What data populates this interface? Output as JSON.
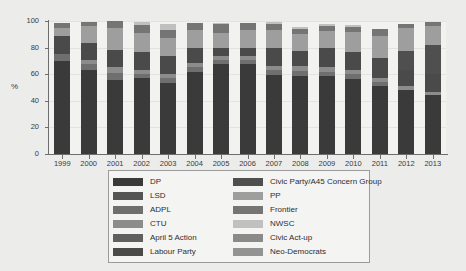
{
  "chart_data": {
    "type": "bar",
    "subtype": "stacked-100-percent",
    "title": "",
    "xlabel": "",
    "ylabel": "%",
    "ylim": [
      0,
      100
    ],
    "yticks": [
      0,
      20,
      40,
      60,
      80,
      100
    ],
    "grid": true,
    "legend_position": "below-plot",
    "legend_columns": 2,
    "categories": [
      "1999",
      "2000",
      "2001",
      "2002",
      "2003",
      "2004",
      "2005",
      "2006",
      "2007",
      "2008",
      "2009",
      "2010",
      "2011",
      "2012",
      "2013"
    ],
    "series": [
      {
        "name": "DP",
        "color": "#3a3a3a",
        "values": [
          70.0,
          63.0,
          55.5,
          57.0,
          53.5,
          62.0,
          67.5,
          67.5,
          59.5,
          59.0,
          58.5,
          56.5,
          51.5,
          48.0,
          44.5
        ]
      },
      {
        "name": "LSD",
        "color": "#545454",
        "values": [
          0.0,
          0.0,
          0.0,
          0.0,
          0.0,
          0.0,
          0.0,
          0.0,
          0.0,
          0.0,
          0.0,
          0.0,
          0.0,
          0.0,
          0.0
        ]
      },
      {
        "name": "ADPL",
        "color": "#6f6f6f",
        "values": [
          5.5,
          4.5,
          5.5,
          3.5,
          4.0,
          3.5,
          3.0,
          3.0,
          3.5,
          3.5,
          3.5,
          3.5,
          3.0,
          0.0,
          0.0
        ]
      },
      {
        "name": "CTU",
        "color": "#8c8c8c",
        "values": [
          0.0,
          3.0,
          4.5,
          3.0,
          3.0,
          3.0,
          3.5,
          3.0,
          3.5,
          3.5,
          3.5,
          3.5,
          3.0,
          3.0,
          2.5
        ]
      },
      {
        "name": "April 5 Action",
        "color": "#606060",
        "values": [
          0.0,
          0.0,
          0.0,
          0.0,
          0.0,
          0.0,
          0.0,
          0.0,
          0.0,
          0.0,
          0.0,
          0.0,
          0.0,
          0.0,
          0.0
        ]
      },
      {
        "name": "Labour Party",
        "color": "#4a4a4a",
        "values": [
          13.0,
          13.0,
          12.5,
          13.5,
          13.5,
          11.0,
          6.0,
          6.0,
          13.5,
          11.5,
          14.5,
          13.5,
          15.0,
          12.0,
          13.5
        ]
      },
      {
        "name": "Civic Party/A45 Concern Group",
        "color": "#4f4f4f",
        "values": [
          0.0,
          0.0,
          0.0,
          0.0,
          0.0,
          0.0,
          0.0,
          0.0,
          0.0,
          0.0,
          0.0,
          0.0,
          0.0,
          14.5,
          21.5
        ]
      },
      {
        "name": "PP",
        "color": "#9e9e9e",
        "values": [
          6.5,
          13.0,
          16.5,
          14.0,
          13.0,
          13.5,
          11.0,
          13.5,
          13.0,
          12.5,
          12.5,
          14.5,
          16.5,
          17.0,
          14.5
        ]
      },
      {
        "name": "Frontier",
        "color": "#757575",
        "values": [
          3.5,
          3.0,
          5.5,
          6.0,
          6.0,
          5.5,
          6.5,
          5.5,
          4.5,
          4.0,
          4.0,
          4.0,
          5.0,
          3.5,
          2.5
        ]
      },
      {
        "name": "NWSC",
        "color": "#c0c0c0",
        "values": [
          0.0,
          0.0,
          0.0,
          2.0,
          4.5,
          0.0,
          1.0,
          0.0,
          2.0,
          1.5,
          1.5,
          1.5,
          0.0,
          0.0,
          0.0
        ]
      },
      {
        "name": "Civic Act-up",
        "color": "#8a8a8a",
        "values": [
          0.0,
          0.0,
          0.0,
          0.0,
          0.0,
          0.0,
          0.0,
          0.0,
          0.0,
          0.0,
          0.0,
          0.0,
          0.0,
          0.0,
          0.0
        ]
      },
      {
        "name": "Neo-Democrats",
        "color": "#939393",
        "values": [
          0.0,
          0.0,
          0.0,
          0.0,
          0.0,
          0.0,
          0.0,
          0.0,
          0.0,
          0.0,
          0.0,
          0.0,
          0.0,
          0.0,
          0.0
        ]
      }
    ],
    "bar_totals": [
      98.5,
      99.5,
      100.0,
      99.0,
      97.5,
      98.5,
      98.5,
      98.5,
      99.5,
      95.5,
      98.0,
      97.0,
      94.0,
      98.0,
      99.0
    ]
  },
  "legend": {
    "columns": [
      {
        "entries": [
          {
            "label": "DP",
            "color": "#3a3a3a"
          },
          {
            "label": "LSD",
            "color": "#545454"
          },
          {
            "label": "ADPL",
            "color": "#6f6f6f"
          },
          {
            "label": "CTU",
            "color": "#8c8c8c"
          },
          {
            "label": "April 5 Action",
            "color": "#606060"
          },
          {
            "label": "Labour Party",
            "color": "#4a4a4a"
          }
        ]
      },
      {
        "entries": [
          {
            "label": "Civic Party/A45 Concern Group",
            "color": "#4f4f4f"
          },
          {
            "label": "PP",
            "color": "#9e9e9e"
          },
          {
            "label": "Frontier",
            "color": "#757575"
          },
          {
            "label": "NWSC",
            "color": "#c0c0c0"
          },
          {
            "label": "Civic Act-up",
            "color": "#8a8a8a"
          },
          {
            "label": "Neo-Democrats",
            "color": "#939393"
          }
        ]
      }
    ]
  }
}
